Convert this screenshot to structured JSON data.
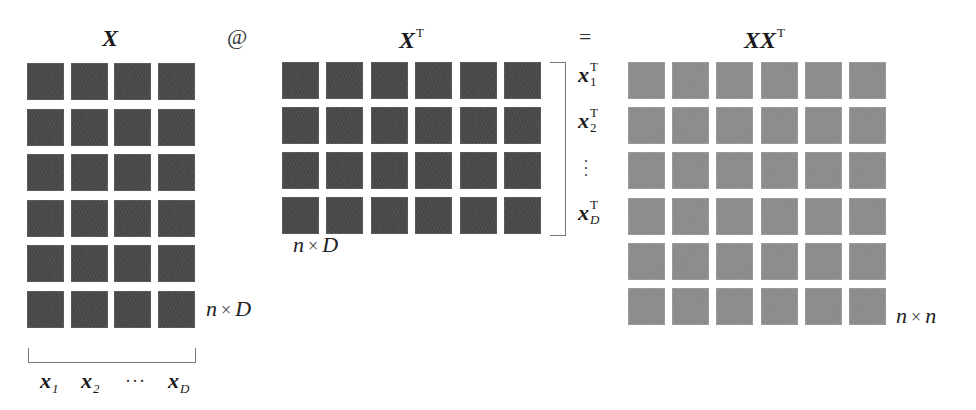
{
  "figure": {
    "colors": {
      "input_cell": "#4b4b4b",
      "output_cell": "#8e8e8e",
      "background": "#ffffff"
    }
  },
  "matrices": {
    "X": {
      "title": "X",
      "rows": 6,
      "cols": 4,
      "dims_label": {
        "left": "n",
        "times": "×",
        "right": "D"
      }
    },
    "XT": {
      "title": "X",
      "title_sup": "T",
      "rows": 4,
      "cols": 6,
      "dims_label": {
        "left": "n",
        "times": "×",
        "right": "D"
      }
    },
    "XXT": {
      "title": "XX",
      "title_sup": "T",
      "rows": 6,
      "cols": 6,
      "dims_label": {
        "left": "n",
        "times": "×",
        "right": "n"
      }
    }
  },
  "operators": {
    "matmul": "@",
    "equals": "="
  },
  "column_vectors": [
    {
      "base": "x",
      "sub": "1"
    },
    {
      "base": "x",
      "sub": "2"
    },
    {
      "ellipsis": "···"
    },
    {
      "base": "x",
      "sub": "D"
    }
  ],
  "row_vectors": [
    {
      "base": "x",
      "sub": "1",
      "sup": "T"
    },
    {
      "base": "x",
      "sub": "2",
      "sup": "T"
    },
    {
      "ellipsis": "⋮"
    },
    {
      "base": "x",
      "sub": "D",
      "sup": "T"
    }
  ]
}
